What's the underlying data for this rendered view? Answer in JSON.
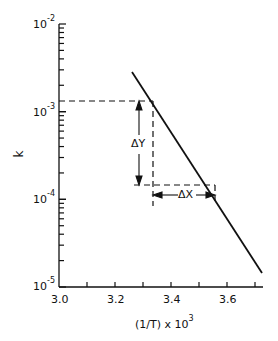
{
  "chart_data": {
    "type": "line",
    "title": "",
    "xlabel": "(1/T) x 10^3",
    "ylabel": "k",
    "yscale": "log",
    "xlim": [
      3.0,
      3.72
    ],
    "ylim": [
      1e-05,
      0.01
    ],
    "x_ticks": [
      3.0,
      3.1,
      3.2,
      3.3,
      3.4,
      3.5,
      3.6,
      3.7
    ],
    "x_tick_labels": [
      "3.0",
      "3.2",
      "3.4",
      "3.6"
    ],
    "y_tick_labels": [
      "10^-2",
      "10^-3",
      "10^-4",
      "10^-5"
    ],
    "grid": false,
    "series": [
      {
        "name": "k",
        "x": [
          3.26,
          3.72
        ],
        "y": [
          0.0027,
          3e-05
        ]
      }
    ],
    "annotations": [
      {
        "text": "ΔY",
        "from": {
          "x": 3.33,
          "y": 0.00125
        },
        "to": {
          "x": 3.33,
          "y": 0.000135
        }
      },
      {
        "text": "ΔX",
        "from": {
          "x": 3.34,
          "y": 0.000135
        },
        "to": {
          "x": 3.56,
          "y": 0.000135
        }
      }
    ]
  },
  "axes": {
    "ylabel": "k",
    "xlabel_main": "(1/T) x 10",
    "xlabel_exp": "3",
    "yticks": [
      {
        "base": "10",
        "exp": "-2"
      },
      {
        "base": "10",
        "exp": "-3"
      },
      {
        "base": "10",
        "exp": "-4"
      },
      {
        "base": "10",
        "exp": "-5"
      }
    ],
    "xticks": [
      "3.0",
      "3.2",
      "3.4",
      "3.6"
    ]
  },
  "annotations": {
    "delta_y": "ΔY",
    "delta_x": "ΔX"
  },
  "colors": {
    "ink": "#111111",
    "background": "#ffffff"
  }
}
